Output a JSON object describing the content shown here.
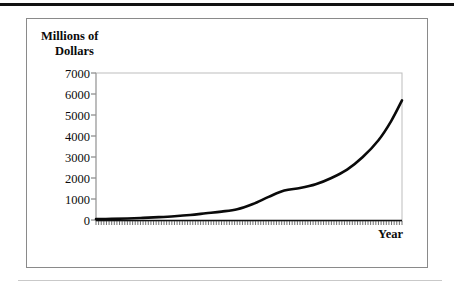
{
  "figure": {
    "top_rule": "thick-black-rule",
    "bottom_rule": "thin-gray-rule"
  },
  "chart_data": {
    "type": "line",
    "title": "",
    "ylabel_line1": "Millions of",
    "ylabel_line2": "Dollars",
    "xlabel": "Year",
    "categories": [
      "1991",
      "1992",
      "1993",
      "1994",
      "1995",
      "1996",
      "1997",
      "1998",
      "1999",
      "2000"
    ],
    "ytick_labels": [
      "7000",
      "6000",
      "5000",
      "4000",
      "3000",
      "2000",
      "1000",
      "0"
    ],
    "ytick_values": [
      7000,
      6000,
      5000,
      4000,
      3000,
      2000,
      1000,
      0
    ],
    "ylim": [
      0,
      7000
    ],
    "xlim": [
      1991,
      2000.75
    ],
    "grid": false,
    "legend": "none",
    "series": [
      {
        "name": "Millions of Dollars",
        "color": "#0a0a0a",
        "x": [
          1991.0,
          1991.5,
          1992.0,
          1992.5,
          1993.0,
          1993.5,
          1994.0,
          1994.5,
          1995.0,
          1995.5,
          1996.0,
          1996.5,
          1997.0,
          1997.5,
          1998.0,
          1998.5,
          1999.0,
          1999.5,
          2000.0,
          2000.4,
          2000.75
        ],
        "values": [
          40,
          55,
          75,
          100,
          135,
          180,
          240,
          320,
          400,
          510,
          760,
          1100,
          1400,
          1520,
          1700,
          2000,
          2400,
          3000,
          3800,
          4700,
          5700
        ]
      }
    ]
  }
}
